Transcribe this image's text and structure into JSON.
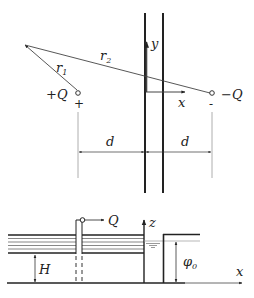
{
  "top_diagram": {
    "charges": {
      "positive_label": "+Q",
      "positive_sign": "+",
      "negative_label": "−Q",
      "negative_sign": "-"
    },
    "distances": {
      "r1_label": "r",
      "r1_sub": "1",
      "r2_label": "r",
      "r2_sub": "2",
      "left_d": "d",
      "right_d": "d"
    },
    "axes": {
      "x_label": "x",
      "y_label": "y"
    }
  },
  "bottom_diagram": {
    "well_flow_label": "Q",
    "aquifer_thickness_label": "H",
    "head_label": "φ",
    "head_sub": "0",
    "z_axis_label": "z",
    "x_axis_label": "x"
  },
  "colors": {
    "line": "#222222",
    "thin_line": "#555555",
    "dimension_line": "#999999"
  }
}
